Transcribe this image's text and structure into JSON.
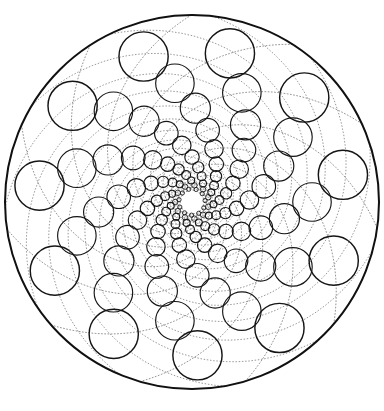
{
  "figure": {
    "kind": "doyle-spiral-circle-packing",
    "background_color": "#ffffff",
    "ink_color": "#151515",
    "guide_color": "#2a2a2a"
  },
  "canvas": {
    "width": 384,
    "height": 411
  },
  "geometry": {
    "center_x": 192,
    "center_y": 202,
    "boundary_radius": 187,
    "boundary_stroke_width": 2.0,
    "arms": 11,
    "turns_inward": 9,
    "turns_outward": 3,
    "growth_ratio": 1.278,
    "arm_twist_radians": 0.3926990817,
    "seed_radius": 120,
    "seed_size_ratio": 0.1605,
    "min_draw_radius": 0.55,
    "circle_stroke_width": 1.15
  },
  "guides": {
    "count_per_family": 11,
    "families": 2,
    "stroke_width": 0.62,
    "dash_pattern": "1.7 1.5",
    "samples": 180,
    "t_min": -9.5,
    "t_max": 3.4
  },
  "legend": {
    "has_text": false,
    "has_axes": false,
    "has_labels": false
  },
  "chart_data": {
    "type": "scatter",
    "xlabel": "",
    "ylabel": "",
    "grid": false,
    "legend_position": "none",
    "ring_radii_px": [
      2.0,
      2.6,
      3.3,
      4.2,
      5.4,
      6.9,
      8.8,
      11.3,
      14.4,
      18.4,
      23.5,
      30.1
    ],
    "ring_distance_px": [
      9,
      12,
      15,
      19,
      25,
      32,
      41,
      52,
      66,
      85,
      109,
      139
    ],
    "arm_count": 11
  }
}
